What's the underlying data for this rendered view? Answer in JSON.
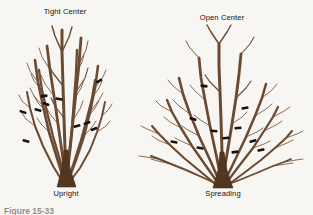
{
  "figure": {
    "background_color": "#f8f6f3",
    "branch_color": "#6b4a31",
    "branch_color_dark": "#4d331f",
    "trunk_color": "#523620",
    "cut_mark_color": "#19120c",
    "label_color": "#16120e",
    "caption_partial": "Figure 15-33"
  },
  "shrubs": [
    {
      "id": "upright",
      "top_label": "Tight Center",
      "bottom_label": "Upright",
      "top_label_x": 65,
      "top_label_y": 14,
      "bottom_label_x": 66,
      "bottom_label_y": 196,
      "habit": "upright",
      "center_type": "tight"
    },
    {
      "id": "spreading",
      "top_label": "Open Center",
      "bottom_label": "Spreading",
      "top_label_x": 222,
      "top_label_y": 20,
      "bottom_label_x": 223,
      "bottom_label_y": 196,
      "habit": "spreading",
      "center_type": "open"
    }
  ],
  "upright_branches": [
    "M66,185 L65,150 L64,118 L63,86 L62,52 L62,30",
    "M66,182 L70,150 L73,120 L76,92 L79,64 L81,38",
    "M66,182 L62,152 L58,124 L54,96 L50,70 L47,46",
    "M65,184 L57,158 L49,132 L43,106 L38,82 L35,60",
    "M67,184 L76,160 L84,136 L90,112 L95,88 L98,66",
    "M66,183 L69,156 L72,128 L74,100 L76,74 L77,50",
    "M66,183 L60,160 L53,136 L47,112 L42,90 L39,70",
    "M67,183 L74,162 L81,140 L87,118 L92,98 L95,80",
    "M64,184 L53,166 L43,146 L35,126 L30,108 L27,92",
    "M68,184 L80,168 L90,150 L97,132 L102,116 L105,102"
  ],
  "upright_twigs": [
    "M62,52 L55,36 L52,26",
    "M62,52 L69,37 L72,27",
    "M63,86 L53,73 L48,64",
    "M64,118 L55,106 L51,98",
    "M76,92 L85,78 L88,68",
    "M79,64 L86,50 L88,41",
    "M54,96 L45,84 L41,75",
    "M50,70 L42,57 L39,48",
    "M43,106 L34,96 L30,88",
    "M38,82 L30,71 L27,63",
    "M90,112 L99,100 L103,93",
    "M95,88 L103,77 L106,70",
    "M74,100 L81,88 L84,80",
    "M76,74 L82,62 L84,55",
    "M47,112 L38,103 L34,96",
    "M42,90 L34,81 L31,74",
    "M87,118 L95,108 L99,101",
    "M92,98 L99,88 L102,81",
    "M35,126 L26,119 L22,113",
    "M30,108 L22,101 L19,95",
    "M97,132 L106,126 L110,121",
    "M102,116 L109,109 L112,104",
    "M73,120 L80,109 L83,101",
    "M58,124 L50,114 L46,107",
    "M49,132 L41,124 L37,118",
    "M84,136 L92,127 L96,121"
  ],
  "upright_cuts": [
    {
      "x": 99,
      "y": 81,
      "angle": -28
    },
    {
      "x": 46,
      "y": 104,
      "angle": 22
    },
    {
      "x": 23,
      "y": 112,
      "angle": 18
    },
    {
      "x": 38,
      "y": 110,
      "angle": 14
    },
    {
      "x": 87,
      "y": 123,
      "angle": -20
    },
    {
      "x": 77,
      "y": 126,
      "angle": -14
    },
    {
      "x": 94,
      "y": 129,
      "angle": -22
    },
    {
      "x": 26,
      "y": 141,
      "angle": 16
    },
    {
      "x": 59,
      "y": 99,
      "angle": 10
    },
    {
      "x": 44,
      "y": 96,
      "angle": -8
    }
  ],
  "spreading_branches": [
    "M222,186 L222,152 L221,120 L220,92 L219,66 L219,44",
    "M222,184 L227,154 L232,124 L236,98 L239,74 L241,54",
    "M222,184 L216,154 L210,126 L205,100 L201,78 L199,58",
    "M221,185 L210,160 L199,136 L190,114 L183,94 L179,78",
    "M223,185 L235,160 L246,137 L255,116 L262,98 L266,84",
    "M220,186 L206,166 L192,146 L181,128 L172,112 L167,100",
    "M224,186 L239,166 L253,148 L264,131 L273,117 L278,107",
    "M219,187 L201,172 L184,158 L170,145 L159,134 L152,126",
    "M225,187 L244,173 L261,160 L275,148 L286,138 L292,131",
    "M221,186 L204,178 L186,170 L171,164 L159,159 L151,156",
    "M224,186 L242,179 L259,172 L273,166 L284,162 L291,159"
  ],
  "spreading_twigs": [
    "M219,44 L211,32 L207,25",
    "M219,44 L227,32 L231,25",
    "M220,92 L210,82 L205,75",
    "M236,98 L246,88 L251,81",
    "M241,54 L250,44 L254,37",
    "M199,58 L190,48 L186,41",
    "M205,100 L195,91 L190,85",
    "M190,114 L179,106 L173,100",
    "M183,94 L173,86 L168,80",
    "M255,116 L266,109 L272,104",
    "M262,98 L272,90 L277,84",
    "M181,128 L170,122 L164,117",
    "M172,112 L161,106 L156,101",
    "M264,131 L276,125 L282,121",
    "M273,117 L284,111 L290,107",
    "M170,145 L158,140 L152,136",
    "M159,134 L147,129 L141,126",
    "M275,148 L287,143 L293,140",
    "M286,138 L297,134 L303,131",
    "M171,164 L158,161 L151,159",
    "M159,159 L146,157 L139,156",
    "M273,166 L286,164 L293,163",
    "M284,162 L296,160 L303,159",
    "M232,124 L242,117 L247,112",
    "M210,126 L199,119 L194,115",
    "M199,136 L188,130 L182,126",
    "M246,137 L257,132 L263,128",
    "M192,146 L181,141 L175,138",
    "M253,148 L264,144 L270,141"
  ],
  "spreading_cuts": [
    {
      "x": 204,
      "y": 86,
      "angle": 8
    },
    {
      "x": 245,
      "y": 108,
      "angle": -10
    },
    {
      "x": 193,
      "y": 119,
      "angle": 14
    },
    {
      "x": 238,
      "y": 128,
      "angle": -6
    },
    {
      "x": 214,
      "y": 131,
      "angle": 4
    },
    {
      "x": 174,
      "y": 142,
      "angle": 12
    },
    {
      "x": 226,
      "y": 138,
      "angle": -4
    },
    {
      "x": 253,
      "y": 141,
      "angle": -14
    },
    {
      "x": 200,
      "y": 148,
      "angle": 10
    },
    {
      "x": 235,
      "y": 152,
      "angle": -8
    },
    {
      "x": 261,
      "y": 150,
      "angle": -12
    }
  ]
}
